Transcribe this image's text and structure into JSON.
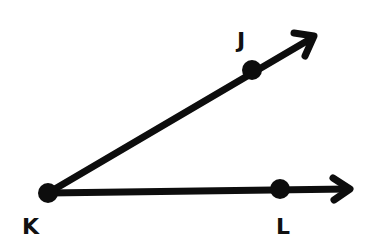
{
  "diagram": {
    "type": "angle",
    "colors": {
      "stroke": "#0d0d0d",
      "background": "#ffffff"
    },
    "points": [
      {
        "id": "K",
        "label": "K",
        "x": 48,
        "y": 193,
        "role": "vertex"
      },
      {
        "id": "J",
        "label": "J",
        "x": 252,
        "y": 70,
        "role": "point-on-ray"
      },
      {
        "id": "L",
        "label": "L",
        "x": 280,
        "y": 189,
        "role": "point-on-ray"
      }
    ],
    "rays": [
      {
        "id": "ray-KJ",
        "from": "K",
        "through": "J",
        "tip": [
          316,
          36
        ]
      },
      {
        "id": "ray-KL",
        "from": "K",
        "through": "L",
        "tip": [
          350,
          189
        ]
      }
    ]
  }
}
